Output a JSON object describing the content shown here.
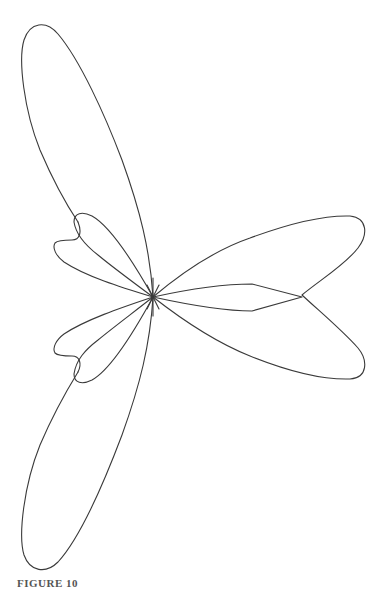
{
  "figure": {
    "center": [
      153,
      297
    ],
    "stroke_color": "#3a3a3a",
    "background": "#ffffff",
    "lobes": [
      {
        "name": "upper-main-lobe",
        "tip": [
          38,
          24
        ]
      },
      {
        "name": "upper-side-lobe",
        "tip": [
          62,
          236
        ]
      },
      {
        "name": "right-lobe-upper",
        "tip": [
          365,
          222
        ]
      },
      {
        "name": "right-lobe-notch",
        "tip": [
          302,
          297
        ]
      },
      {
        "name": "right-lobe-lower",
        "tip": [
          365,
          372
        ]
      },
      {
        "name": "right-inner-lobe",
        "tip": [
          302,
          297
        ]
      },
      {
        "name": "lower-side-lobe",
        "tip": [
          62,
          358
        ]
      },
      {
        "name": "lower-main-lobe",
        "tip": [
          42,
          568
        ]
      }
    ]
  },
  "caption": {
    "text": "FIGURE 10"
  }
}
